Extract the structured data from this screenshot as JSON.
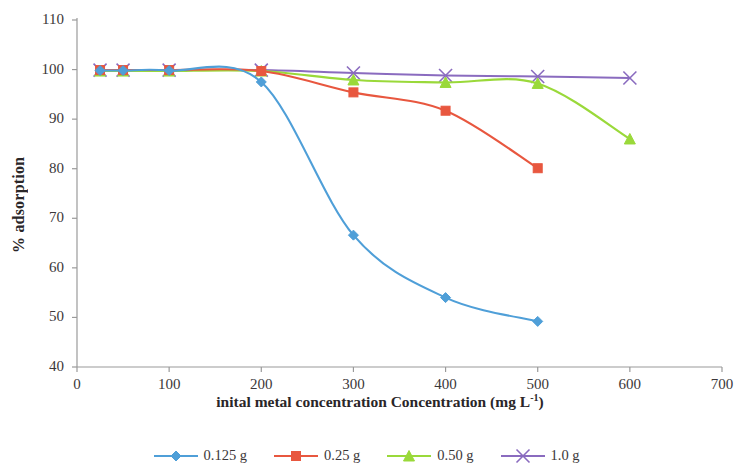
{
  "chart_data": {
    "type": "line",
    "title": "",
    "xlabel": "inital metal concentration Concentration (mg L-1)",
    "xlabel_main": "inital metal concentration Concentration (mg L",
    "xlabel_sup": "-1",
    "xlabel_tail": ")",
    "ylabel": "% adsorption",
    "xlim": [
      0,
      700
    ],
    "ylim": [
      40,
      110
    ],
    "xticks": [
      0,
      100,
      200,
      300,
      400,
      500,
      600,
      700
    ],
    "yticks": [
      40,
      50,
      60,
      70,
      80,
      90,
      100,
      110
    ],
    "xtick_labels": [
      "0",
      "100",
      "200",
      "300",
      "400",
      "500",
      "600",
      "700"
    ],
    "ytick_labels": [
      "40",
      "50",
      "60",
      "70",
      "80",
      "90",
      "100",
      "110"
    ],
    "grid": false,
    "legend_position": "bottom",
    "series": [
      {
        "name": "0.125 g",
        "color": "#4f9fd8",
        "marker": "diamond",
        "x": [
          25,
          50,
          100,
          200,
          300,
          400,
          500
        ],
        "y": [
          99.8,
          99.8,
          99.8,
          97.5,
          66.6,
          54.0,
          49.2
        ]
      },
      {
        "name": "0.25 g",
        "color": "#e8573f",
        "marker": "square",
        "x": [
          25,
          50,
          100,
          200,
          300,
          400,
          500
        ],
        "y": [
          99.9,
          99.9,
          99.9,
          99.7,
          95.4,
          91.7,
          80.1
        ]
      },
      {
        "name": "0.50 g",
        "color": "#9ad93a",
        "marker": "triangle",
        "x": [
          25,
          50,
          100,
          200,
          300,
          400,
          500,
          600
        ],
        "y": [
          99.7,
          99.7,
          99.7,
          99.7,
          97.9,
          97.4,
          97.2,
          86.0
        ]
      },
      {
        "name": "1.0 g",
        "color": "#8a6bbf",
        "marker": "cross",
        "x": [
          25,
          50,
          100,
          200,
          300,
          400,
          500,
          600
        ],
        "y": [
          99.9,
          99.9,
          99.9,
          99.9,
          99.3,
          98.8,
          98.6,
          98.3
        ]
      }
    ]
  },
  "legend": {
    "items": [
      {
        "label": "0.125 g"
      },
      {
        "label": "0.25 g"
      },
      {
        "label": "0.50 g"
      },
      {
        "label": "1.0 g"
      }
    ]
  }
}
